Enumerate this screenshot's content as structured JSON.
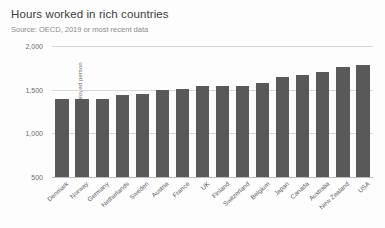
{
  "chart_data": {
    "type": "bar",
    "title": "Hours worked in rich countries",
    "subtitle": "Source: OECD, 2019 or most recent data",
    "xlabel": "",
    "ylabel": "Working hours per employed person",
    "ylim": [
      500,
      2000
    ],
    "yticks": [
      500,
      1000,
      1500,
      2000
    ],
    "ytick_labels": [
      "500",
      "1,000",
      "1,500",
      "2,000"
    ],
    "grid": true,
    "legend": false,
    "bar_color": "#595959",
    "categories": [
      "Denmark",
      "Norway",
      "Germany",
      "Netherlands",
      "Sweden",
      "Austria",
      "France",
      "UK",
      "Finland",
      "Switzerland",
      "Belgium",
      "Japan",
      "Canada",
      "Australia",
      "New Zealand",
      "USA"
    ],
    "values": [
      1390,
      1390,
      1395,
      1435,
      1455,
      1500,
      1505,
      1540,
      1540,
      1545,
      1580,
      1645,
      1670,
      1705,
      1755,
      1780
    ]
  }
}
